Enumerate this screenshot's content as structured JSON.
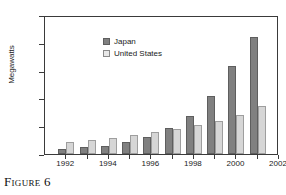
{
  "figure": {
    "caption": "Figure 6"
  },
  "chart_data": {
    "type": "bar",
    "title": "",
    "xlabel": "",
    "ylabel": "Megawatts",
    "categories": [
      "1992",
      "1993",
      "1994",
      "1995",
      "1996",
      "1997",
      "1998",
      "1999",
      "2000",
      "2001"
    ],
    "series": [
      {
        "name": "Japan",
        "color": "#808080",
        "values": [
          19,
          25,
          30,
          43,
          60,
          94,
          135,
          210,
          318,
          420
        ]
      },
      {
        "name": "United States",
        "color": "#d6d6d6",
        "values": [
          44,
          51,
          59,
          69,
          78,
          89,
          103,
          118,
          140,
          172
        ]
      }
    ],
    "ylim": [
      0,
      500
    ],
    "yticks": [
      "0",
      "100",
      "200",
      "300",
      "400",
      "500"
    ],
    "xticks": [
      "1992",
      "1994",
      "1996",
      "1998",
      "2000",
      "2002"
    ],
    "grid": false,
    "legend_position": "top-left"
  }
}
